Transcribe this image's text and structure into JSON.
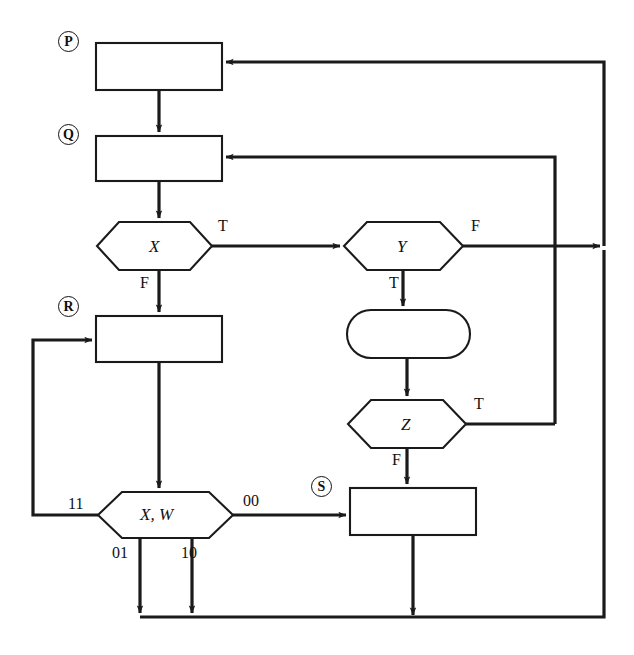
{
  "diagram": {
    "kind": "flowchart",
    "title": "",
    "background_color": "#ffffff",
    "line_color": "#1a1a1a",
    "state_markers": [
      {
        "id": "P",
        "label": "P",
        "x": 58,
        "y": 31
      },
      {
        "id": "Q",
        "label": "Q",
        "x": 58,
        "y": 124
      },
      {
        "id": "R",
        "label": "R",
        "x": 58,
        "y": 296
      },
      {
        "id": "S",
        "label": "S",
        "x": 311,
        "y": 476
      }
    ],
    "nodes": [
      {
        "id": "box-p",
        "shape": "rectangle",
        "label": "",
        "x": 96,
        "y": 43,
        "w": 126,
        "h": 47
      },
      {
        "id": "box-q",
        "shape": "rectangle",
        "label": "",
        "x": 96,
        "y": 136,
        "w": 126,
        "h": 45
      },
      {
        "id": "dec-x",
        "shape": "hexagon",
        "label": "X",
        "x": 97,
        "y": 222,
        "w": 115,
        "h": 48
      },
      {
        "id": "box-r",
        "shape": "rectangle",
        "label": "",
        "x": 96,
        "y": 316,
        "w": 126,
        "h": 46
      },
      {
        "id": "dec-xw",
        "shape": "hexagon",
        "label": "X, W",
        "x": 98,
        "y": 492,
        "w": 135,
        "h": 46
      },
      {
        "id": "dec-y",
        "shape": "hexagon",
        "label": "Y",
        "x": 344,
        "y": 222,
        "w": 119,
        "h": 48
      },
      {
        "id": "proc-stadium",
        "shape": "stadium",
        "label": "",
        "x": 347,
        "y": 310,
        "w": 123,
        "h": 48
      },
      {
        "id": "dec-z",
        "shape": "hexagon",
        "label": "Z",
        "x": 348,
        "y": 400,
        "w": 118,
        "h": 48
      },
      {
        "id": "box-s",
        "shape": "rectangle",
        "label": "",
        "x": 350,
        "y": 488,
        "w": 126,
        "h": 47
      }
    ],
    "edge_labels": [
      {
        "id": "x-true",
        "text": "T",
        "x": 218,
        "y": 218
      },
      {
        "id": "x-false",
        "text": "F",
        "x": 140,
        "y": 275
      },
      {
        "id": "y-false",
        "text": "F",
        "x": 471,
        "y": 218
      },
      {
        "id": "y-true",
        "text": "T",
        "x": 389,
        "y": 275
      },
      {
        "id": "z-true",
        "text": "T",
        "x": 474,
        "y": 396
      },
      {
        "id": "z-false",
        "text": "F",
        "x": 392,
        "y": 452
      },
      {
        "id": "xw-11",
        "text": "11",
        "x": 68,
        "y": 496
      },
      {
        "id": "xw-00",
        "text": "00",
        "x": 243,
        "y": 493
      },
      {
        "id": "xw-01",
        "text": "01",
        "x": 112,
        "y": 545
      },
      {
        "id": "xw-10",
        "text": "10",
        "x": 181,
        "y": 545
      }
    ],
    "rails": {
      "outer_right_x": 604,
      "inner_right_x": 555,
      "bottom_rail_y": 617,
      "left_loop_x": 33
    }
  }
}
